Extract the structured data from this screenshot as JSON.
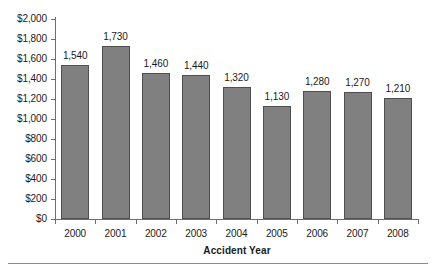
{
  "chart_data": {
    "type": "bar",
    "title": "",
    "subtitle": "",
    "xlabel": "Accident Year",
    "ylabel": "",
    "categories": [
      "2000",
      "2001",
      "2002",
      "2003",
      "2004",
      "2005",
      "2006",
      "2007",
      "2008"
    ],
    "values": [
      1540,
      1730,
      1460,
      1440,
      1320,
      1130,
      1280,
      1270,
      1210
    ],
    "data_labels": [
      "1,540",
      "1,730",
      "1,460",
      "1,440",
      "1,320",
      "1,130",
      "1,280",
      "1,270",
      "1,210"
    ],
    "ylim": [
      0,
      2000
    ],
    "ytick_values": [
      0,
      200,
      400,
      600,
      800,
      1000,
      1200,
      1400,
      1600,
      1800,
      2000
    ],
    "ytick_labels": [
      "$0",
      "$200",
      "$400",
      "$600",
      "$800",
      "$1,000",
      "$1,200",
      "$1,400",
      "$1,600",
      "$1,800",
      "$2,000"
    ],
    "grid": false,
    "legend": null,
    "legend_position": "none",
    "bar_color": "#808080",
    "bar_border_color": "#4f4f4f",
    "axis_color": "#6e6e6e",
    "text_color": "#1a1a1a",
    "background_color": "#ffffff"
  },
  "figure": {
    "bottom_rule_color": "#8c8c8c"
  }
}
